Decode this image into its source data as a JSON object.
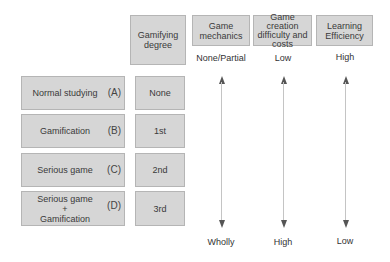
{
  "header": {
    "gamifying_degree": "Gamifying\ndegree",
    "columns": [
      {
        "title": "Game mechanics",
        "top": "None/Partial",
        "bottom": "Wholly"
      },
      {
        "title": "Game creation difficulty and costs",
        "top": "Low",
        "bottom": "High"
      },
      {
        "title": "Learning Efficiency",
        "top": "High",
        "bottom": "Low"
      }
    ]
  },
  "rows": [
    {
      "label": "Normal studying",
      "letter": "(A)",
      "degree": "None"
    },
    {
      "label": "Gamification",
      "letter": "(B)",
      "degree": "1st"
    },
    {
      "label": "Serious game",
      "letter": "(C)",
      "degree": "2nd"
    },
    {
      "label_lines": [
        "Serious game",
        "+",
        "Gamification"
      ],
      "letter": "(D)",
      "degree": "3rd"
    }
  ]
}
